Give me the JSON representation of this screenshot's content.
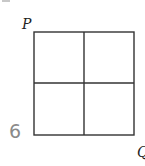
{
  "diagram": {
    "type": "grid-square",
    "rows": 2,
    "cols": 2,
    "line_color": "#333333",
    "labels": {
      "top_left_vertex": "P",
      "bottom_right_vertex": "Q",
      "problem_number": "6"
    }
  }
}
